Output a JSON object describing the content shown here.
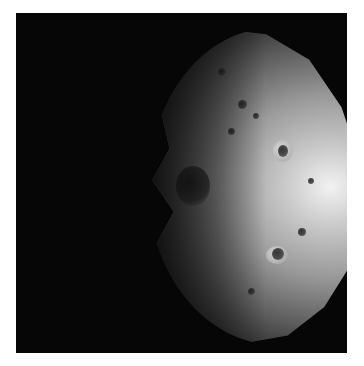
{
  "image": {
    "subject": "Cratered asteroid (Vesta-like body), partially illuminated from the right",
    "background_color": "#060606",
    "border_color": "#ffffff",
    "highlight_color": "#f2f2f2"
  }
}
